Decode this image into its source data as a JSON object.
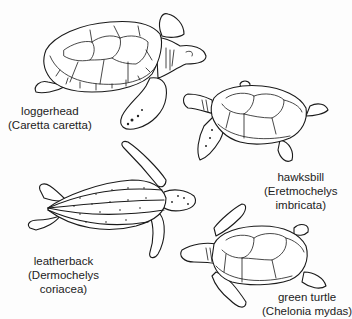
{
  "figure": {
    "turtles": [
      {
        "id": "loggerhead",
        "common_name": "loggerhead",
        "scientific_name": "(Caretta caretta)"
      },
      {
        "id": "hawksbill",
        "common_name": "hawksbill",
        "scientific_name_line1": "(Eretmochelys",
        "scientific_name_line2": "imbricata)"
      },
      {
        "id": "leatherback",
        "common_name": "leatherback",
        "scientific_name_line1": "(Dermochelys",
        "scientific_name_line2": "coriacea)"
      },
      {
        "id": "green-turtle",
        "common_name": "green turtle",
        "scientific_name": "(Chelonia mydas)"
      }
    ]
  }
}
